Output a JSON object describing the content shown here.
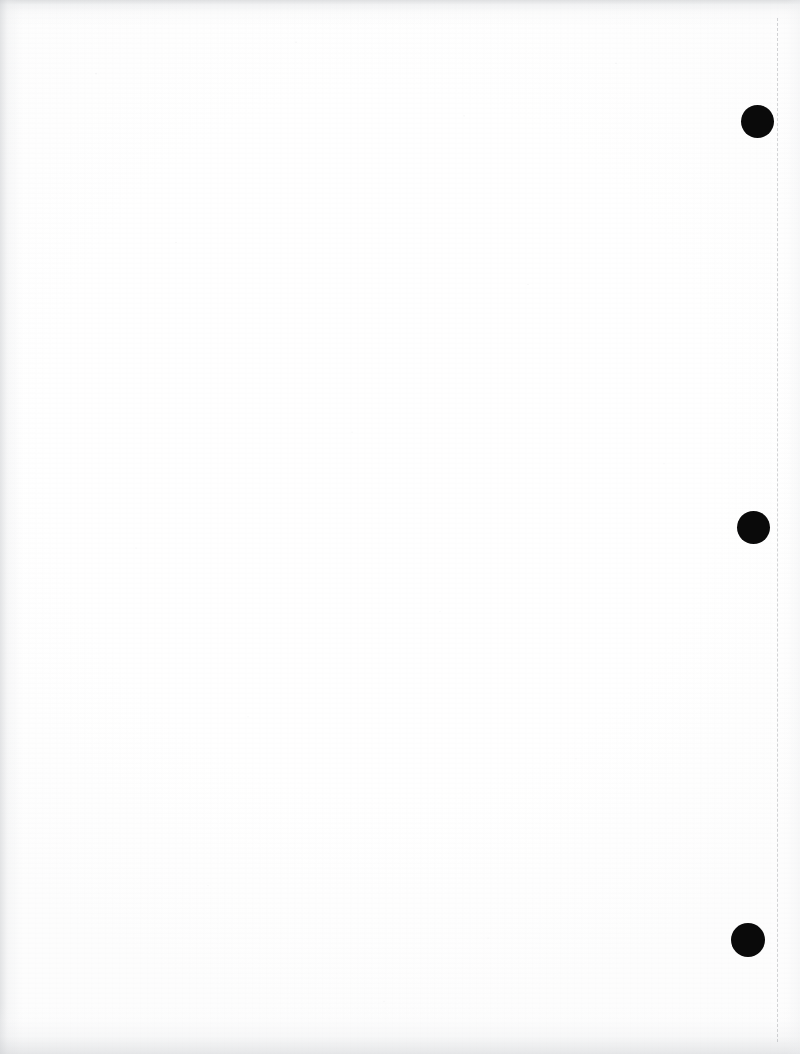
{
  "document": {
    "kind": "scanned-page",
    "page_label": "",
    "body_text": "",
    "background_color": "#ffffff",
    "ink_color": "#0a0a0a",
    "width_px": 800,
    "height_px": 1054,
    "note": "Blank scanned document page; no printed text visible."
  },
  "marks": {
    "crease_line": {
      "name": "dashed-fold-line",
      "x": 777,
      "y_start": 18,
      "y_end": 1042,
      "color": "#96989d",
      "style": "dashed"
    },
    "dots": [
      {
        "name": "punch-mark-top",
        "cx": 757,
        "cy": 121,
        "r": 16.5,
        "color": "#0a0a0a"
      },
      {
        "name": "punch-mark-middle",
        "cx": 753,
        "cy": 527,
        "r": 16.5,
        "color": "#0a0a0a"
      },
      {
        "name": "punch-mark-bottom",
        "cx": 748,
        "cy": 940,
        "r": 17.0,
        "color": "#0a0a0a"
      }
    ]
  },
  "scan_artifacts": {
    "top_edge_shadow": "#c4c6c9",
    "left_edge_shadow": "#cdcfd2",
    "bottom_edge_shadow": "#cfd1d4",
    "right_edge_shadow": "#ecedef",
    "paper_tint": "#fdfdfd"
  }
}
